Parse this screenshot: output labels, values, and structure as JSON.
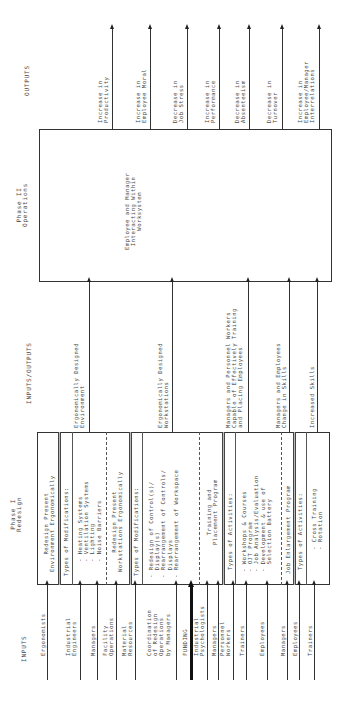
{
  "headers": {
    "outputs": "OUTPUTS",
    "inputs_outputs": "INPUTS/OUTPUTS",
    "inputs": "INPUTS"
  },
  "phase2": {
    "title": "Phase II\nOperations",
    "body": "Employee and Manager\nInteracting Within\nWorksystem"
  },
  "phase1": {
    "title": "Phase I\nRedesign",
    "sections": [
      "Redesign Present\nEnvironment Ergonomically",
      "Types of Modifications:",
      "- Heating Systems\n- Ventilation Systems\n- Lighting\n- Noise Barriers",
      "Redesign Present\nWorkstations Ergonomically",
      "Types of Modifications:",
      "- Redesign of Control(s)/\n  Display(s)\n- Rearrangement of Controls/\n  Displays\n- Rearrangement of Workspace",
      "Training and\nPlacement Program",
      "Types of Activities:",
      "- Workshops & Courses\n- OJT Program\n- Job Analysis/Evaluation\n- Development & use of\n  Selection Battery",
      "Job Enlargement Program",
      "Types of Activities:",
      "- Cross Training\n- Rotation"
    ]
  },
  "outputs": [
    "Increase in\nProductivity",
    "Increase in\nEmployee Moral",
    "Decrease in\nJob Stress",
    "Increase in\nPerformance",
    "Decrease in\nAbsenteeism",
    "Decrease in\nTurnover",
    "Increase in\nEmployee/Manager\nInterrelations"
  ],
  "intermediate": [
    "Ergonomically Designed\nEnvironment",
    "Ergonomically Designed\nWorkstations",
    "Managers and Personnel Workers\nCapable of Effectively Training\nand Placing Employees",
    "Managers and Employees\nChange in Skills",
    "Increased Skills"
  ],
  "inputs": [
    "Ergonomists",
    "Industrial\nEngineers",
    "Managers",
    "Facility\nOperations",
    "Material\nResources",
    "Coordination\nof Redesign\nOperations\nby Managers",
    "FUNDING",
    "Industrial\nPsychologists",
    "Managers",
    "Personnel\nWorkers",
    "Trainers",
    "Employees",
    "Managers",
    "Employees",
    "Trainers"
  ]
}
